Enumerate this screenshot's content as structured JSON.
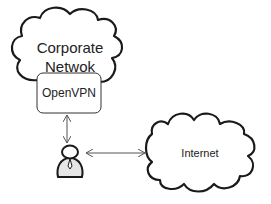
{
  "diagram": {
    "nodes": {
      "corporate_network": {
        "label_line1": "Corporate",
        "label_line2": "Netwok",
        "shape": "cloud"
      },
      "openvpn": {
        "label": "OpenVPN",
        "shape": "rounded-rectangle"
      },
      "user": {
        "icon": "person-icon",
        "shape": "user-figure"
      },
      "internet": {
        "label": "Internet",
        "shape": "cloud"
      }
    },
    "edges": [
      {
        "from": "openvpn",
        "to": "user",
        "style": "bidirectional-arrow"
      },
      {
        "from": "user",
        "to": "internet",
        "style": "bidirectional-arrow"
      }
    ],
    "colors": {
      "stroke": "#1a1a1a",
      "arrow": "#555555",
      "text": "#222222",
      "background": "#ffffff"
    }
  }
}
